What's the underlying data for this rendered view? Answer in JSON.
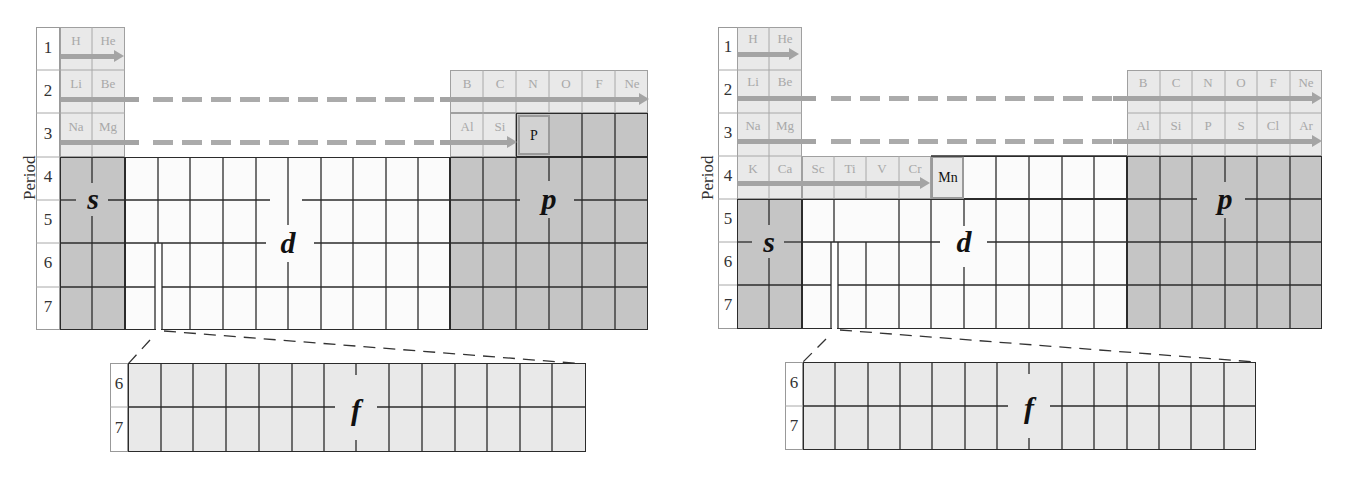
{
  "figures": [
    {
      "id": "left",
      "axis_label": "Period",
      "periods": [
        "1",
        "2",
        "3",
        "4",
        "5",
        "6",
        "7"
      ],
      "block_labels": {
        "s": "s",
        "d": "d",
        "p": "p",
        "f": "f"
      },
      "f_periods": [
        "6",
        "7"
      ],
      "elements": {
        "row1": [
          "H",
          "He"
        ],
        "row2_s": [
          "Li",
          "Be"
        ],
        "row2_p": [
          "B",
          "C",
          "N",
          "O",
          "F",
          "Ne"
        ],
        "row3_s": [
          "Na",
          "Mg"
        ],
        "row3_p": [
          "Al",
          "Si"
        ],
        "highlight": "P"
      }
    },
    {
      "id": "right",
      "axis_label": "Period",
      "periods": [
        "1",
        "2",
        "3",
        "4",
        "5",
        "6",
        "7"
      ],
      "block_labels": {
        "s": "s",
        "d": "d",
        "p": "p",
        "f": "f"
      },
      "f_periods": [
        "6",
        "7"
      ],
      "elements": {
        "row1": [
          "H",
          "He"
        ],
        "row2_s": [
          "Li",
          "Be"
        ],
        "row2_p": [
          "B",
          "C",
          "N",
          "O",
          "F",
          "Ne"
        ],
        "row3_s": [
          "Na",
          "Mg"
        ],
        "row3_p": [
          "Al",
          "Si",
          "P",
          "S",
          "Cl",
          "Ar"
        ],
        "row4": [
          "K",
          "Ca",
          "Sc",
          "Ti",
          "V",
          "Cr"
        ],
        "highlight": "Mn"
      }
    }
  ],
  "colors": {
    "s_block": "#c5c5c5",
    "p_block": "#c5c5c5",
    "d_block": "#fbfbfb",
    "f_block": "#e9e9e9",
    "filled_rows": "#e9e9e9",
    "arrow": "#a4a4a4",
    "grid": "#2b2b2b"
  }
}
